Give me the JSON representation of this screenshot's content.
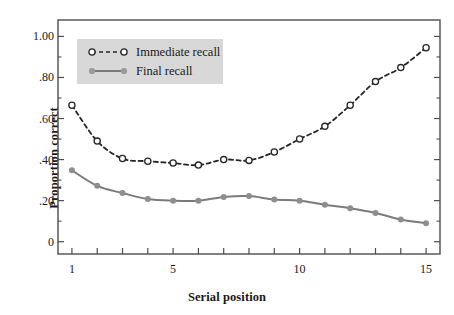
{
  "chart_data": {
    "type": "line",
    "title": "",
    "xlabel": "Serial position",
    "ylabel": "Proportion correct",
    "x": [
      1,
      2,
      3,
      4,
      5,
      6,
      7,
      8,
      9,
      10,
      11,
      12,
      13,
      14,
      15
    ],
    "xlim": [
      0.45,
      15.55
    ],
    "ylim": [
      -0.06,
      1.08
    ],
    "xticks": [
      1,
      2,
      3,
      4,
      5,
      6,
      7,
      8,
      9,
      10,
      11,
      12,
      13,
      14,
      15
    ],
    "xtick_labels_shown": [
      {
        "value": 1,
        "label": "1"
      },
      {
        "value": 5,
        "label": "5"
      },
      {
        "value": 10,
        "label": "10"
      },
      {
        "value": 15,
        "label": "15"
      }
    ],
    "yticks_major": [
      {
        "value": 0.0,
        "label": "0"
      },
      {
        "value": 0.2,
        "label": ".20"
      },
      {
        "value": 0.4,
        "label": ".40"
      },
      {
        "value": 0.6,
        "label": ".60"
      },
      {
        "value": 0.8,
        "label": ".80"
      },
      {
        "value": 1.0,
        "label": "1.00"
      }
    ],
    "yticks_minor": [
      0.1,
      0.3,
      0.5,
      0.7,
      0.9
    ],
    "grid": false,
    "legend_position": "upper-left",
    "series": [
      {
        "name": "Immediate recall",
        "color": "#262626",
        "linestyle": "dashed",
        "marker": "open-circle",
        "values": [
          0.665,
          0.49,
          0.405,
          0.392,
          0.383,
          0.373,
          0.4,
          0.396,
          0.437,
          0.5,
          0.562,
          0.665,
          0.78,
          0.848,
          0.945
        ]
      },
      {
        "name": "Final recall",
        "color": "#7b7b7b",
        "linestyle": "solid",
        "marker": "filled-circle",
        "values": [
          0.348,
          0.272,
          0.237,
          0.208,
          0.2,
          0.2,
          0.218,
          0.222,
          0.205,
          0.2,
          0.18,
          0.163,
          0.14,
          0.108,
          0.09
        ]
      }
    ]
  },
  "legend": {
    "background": "#d8d8d8",
    "entries": [
      {
        "label": "Immediate recall"
      },
      {
        "label": "Final recall"
      }
    ]
  },
  "axes": {
    "frame_color": "#4d4d4d"
  }
}
